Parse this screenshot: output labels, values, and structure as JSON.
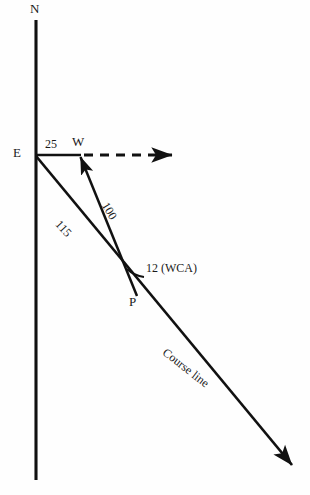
{
  "diagram": {
    "background_color": "#fefefe",
    "line_color": "#111111",
    "labels": {
      "north": "N",
      "east_point": "E",
      "wind_point": "W",
      "plane_point": "P",
      "wind_speed": "25",
      "true_course_value": "115",
      "heading_value": "100",
      "wca": "12 (WCA)",
      "course_line": "Course line"
    },
    "elements": [
      {
        "name": "north-axis",
        "type": "line",
        "from": [
          36,
          20
        ],
        "to": [
          36,
          480
        ],
        "style": "solid"
      },
      {
        "name": "wind-segment",
        "type": "line",
        "from": [
          36,
          155
        ],
        "to": [
          80,
          155
        ],
        "style": "solid",
        "label": "25"
      },
      {
        "name": "dashed-reference-line",
        "type": "line",
        "from": [
          80,
          155
        ],
        "to": [
          176,
          155
        ],
        "style": "dashed",
        "arrow": "end"
      },
      {
        "name": "heading-line",
        "type": "line",
        "from": [
          137,
          296
        ],
        "to": [
          79,
          153
        ],
        "style": "solid",
        "arrow": "end",
        "label": "100"
      },
      {
        "name": "course-line",
        "type": "line",
        "from": [
          36,
          156
        ],
        "to": [
          296,
          470
        ],
        "style": "solid",
        "arrow": "end",
        "label": "115 / Course line"
      },
      {
        "name": "wca-arc",
        "type": "arc",
        "vertex": [
          137,
          296
        ],
        "label": "12 (WCA)"
      }
    ]
  }
}
